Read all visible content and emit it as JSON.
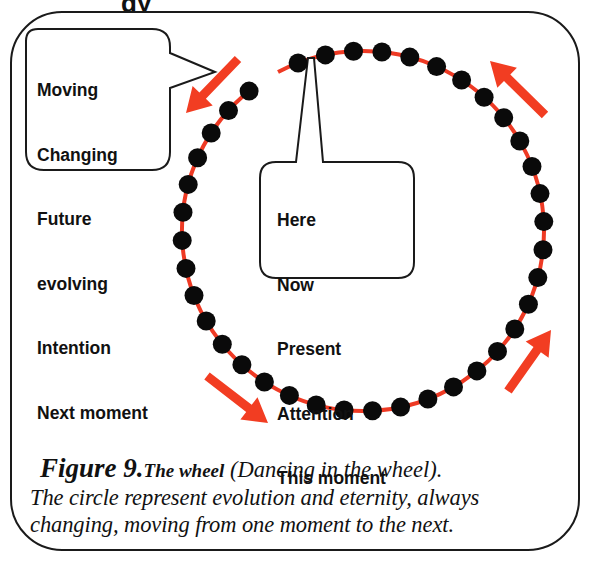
{
  "colors": {
    "bead": "#0a0a0a",
    "string": "#ee3a24",
    "arrow": "#f23d22",
    "outline": "#1a1a1a",
    "background": "#ffffff"
  },
  "header_fragment": "gy",
  "wheel": {
    "center_x": 363,
    "center_y": 231,
    "radius_x": 181,
    "radius_y": 180,
    "bead_count": 40,
    "bead_radius": 9.5,
    "gap_start_deg": 232,
    "gap_end_deg": 242,
    "pointer_bead_deg": 267
  },
  "bubbles": {
    "future": {
      "lines": [
        "Moving",
        "Changing",
        "Future",
        "evolving",
        "Intention",
        "Next moment"
      ]
    },
    "present": {
      "lines": [
        "Here",
        "Now",
        "Present",
        "Attention",
        "This moment"
      ]
    }
  },
  "arrows": [
    {
      "name": "top-left-arrow",
      "direction": "down-left",
      "x1": 238,
      "y1": 59,
      "x2": 186,
      "y2": 113
    },
    {
      "name": "top-right-arrow",
      "direction": "up-left",
      "x1": 545,
      "y1": 115,
      "x2": 490,
      "y2": 61
    },
    {
      "name": "bottom-left-arrow",
      "direction": "down-right",
      "x1": 207,
      "y1": 376,
      "x2": 268,
      "y2": 423
    },
    {
      "name": "bottom-right-arrow",
      "direction": "up-right",
      "x1": 508,
      "y1": 391,
      "x2": 551,
      "y2": 330
    }
  ],
  "caption": {
    "figure_label": "Figure 9.",
    "title": "The wheel",
    "subtitle": " (Dancing in the wheel).",
    "line2": "The circle represent evolution and eternity, always",
    "line3": "changing, moving from one moment to the next."
  }
}
